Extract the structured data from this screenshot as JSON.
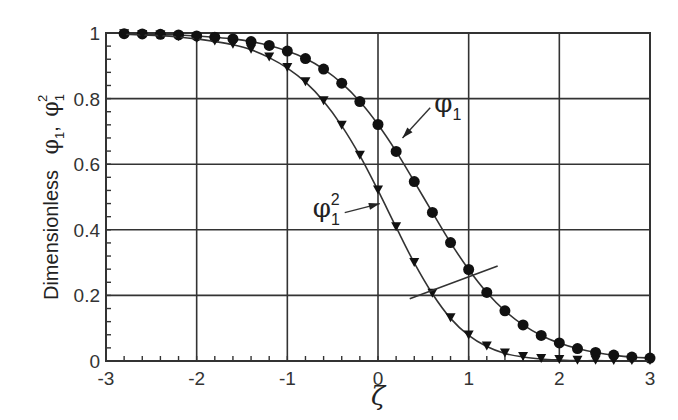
{
  "chart_data": {
    "type": "line",
    "title": "",
    "xlabel": "ζ",
    "ylabel": "Dimensionless  φ1, φ1^2",
    "ylabel_parts": {
      "word": "Dimensionless",
      "sym1": "φ",
      "sub1": "1",
      "sep": ",",
      "sym2": "φ",
      "sub2": "1",
      "sup2": "2"
    },
    "xlim": [
      -3,
      3
    ],
    "ylim": [
      0,
      1
    ],
    "x_ticks": [
      "-3",
      "-2",
      "-1",
      "0",
      "1",
      "2",
      "3"
    ],
    "y_ticks": [
      "0",
      "0.2",
      "0.4",
      "0.6",
      "0.8",
      "1"
    ],
    "grid": true,
    "legend_position": "inline-annotations",
    "x": [
      -2.8,
      -2.6,
      -2.4,
      -2.2,
      -2.0,
      -1.8,
      -1.6,
      -1.4,
      -1.2,
      -1.0,
      -0.8,
      -0.6,
      -0.4,
      -0.2,
      0.0,
      0.2,
      0.4,
      0.6,
      0.8,
      1.0,
      1.2,
      1.4,
      1.6,
      1.8,
      2.0,
      2.2,
      2.4,
      2.6,
      2.8,
      3.0
    ],
    "series": [
      {
        "name": "φ1",
        "marker": "circle",
        "values": [
          0.998,
          0.997,
          0.996,
          0.994,
          0.991,
          0.987,
          0.982,
          0.974,
          0.962,
          0.945,
          0.922,
          0.89,
          0.847,
          0.791,
          0.721,
          0.639,
          0.547,
          0.453,
          0.361,
          0.279,
          0.209,
          0.153,
          0.11,
          0.078,
          0.055,
          0.038,
          0.026,
          0.018,
          0.012,
          0.009
        ]
      },
      {
        "name": "φ1^2",
        "marker": "triangle-down",
        "values": [
          0.996,
          0.994,
          0.992,
          0.988,
          0.982,
          0.974,
          0.964,
          0.949,
          0.925,
          0.893,
          0.85,
          0.792,
          0.717,
          0.626,
          0.52,
          0.408,
          0.299,
          0.205,
          0.13,
          0.078,
          0.044,
          0.023,
          0.012,
          0.006,
          0.003,
          0.001,
          0.001,
          0.0,
          0.0,
          0.0
        ]
      }
    ],
    "annotations": [
      {
        "label": "φ1",
        "sym": "φ",
        "sub": "1",
        "sup": "",
        "text_x": 0.62,
        "text_y": 0.76,
        "arrow_to": [
          0.27,
          0.68
        ]
      },
      {
        "label": "φ1^2",
        "sym": "φ",
        "sub": "1",
        "sup": "2",
        "text_x": -0.72,
        "text_y": 0.44,
        "arrow_to": [
          0.02,
          0.48
        ]
      },
      {
        "label": "",
        "type": "bracket-line",
        "from": [
          0.35,
          0.19
        ],
        "to": [
          1.32,
          0.29
        ]
      }
    ]
  }
}
